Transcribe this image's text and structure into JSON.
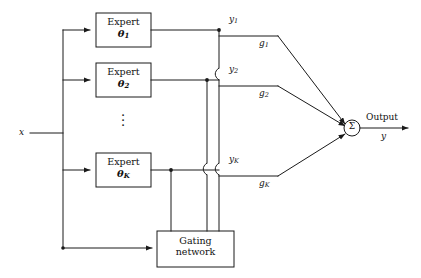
{
  "diagram": {
    "input": {
      "label": "x",
      "name": "input-signal"
    },
    "experts": [
      {
        "title": "Expert",
        "param": "θ",
        "subscript": "1",
        "output_label": "y",
        "output_subscript": "1",
        "gate_label": "g",
        "gate_subscript": "1"
      },
      {
        "title": "Expert",
        "param": "θ",
        "subscript": "2",
        "output_label": "y",
        "output_subscript": "2",
        "gate_label": "g",
        "gate_subscript": "2"
      },
      {
        "title": "Expert",
        "param": "θ",
        "subscript": "K",
        "output_label": "y",
        "output_subscript": "K",
        "gate_label": "g",
        "gate_subscript": "K"
      }
    ],
    "ellipsis": "⋮",
    "gating": {
      "line1": "Gating",
      "line2": "network"
    },
    "summation": {
      "symbol": "Σ",
      "name": "sum-node"
    },
    "output": {
      "label": "Output",
      "variable": "y"
    },
    "colors": {
      "line": "#1a1a1a",
      "background": "#ffffff",
      "text": "#111111"
    }
  }
}
